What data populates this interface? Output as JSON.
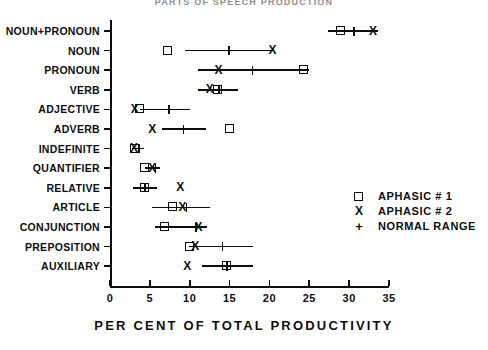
{
  "chart_data": {
    "type": "scatter",
    "title": "PARTS OF SPEECH PRODUCTION",
    "xlabel": "PER CENT OF TOTAL PRODUCTIVITY",
    "ylabel": "",
    "xlim": [
      0,
      35
    ],
    "xticks": [
      0,
      5,
      10,
      15,
      20,
      25,
      30,
      35
    ],
    "xticklabels": [
      "0",
      "5",
      "10",
      "15",
      "20",
      "25",
      "30",
      "35"
    ],
    "grid": false,
    "legend_position": "middle-right",
    "categories": [
      "NOUN+PRONOUN",
      "NOUN",
      "PRONOUN",
      "VERB",
      "ADJECTIVE",
      "ADVERB",
      "INDEFINITE",
      "QUANTIFIER",
      "RELATIVE",
      "ARTICLE",
      "CONJUNCTION",
      "PREPOSITION",
      "AUXILIARY"
    ],
    "series": [
      {
        "name": "APHASIC # 1",
        "marker": "square",
        "values": [
          29.0,
          7.3,
          24.3,
          13.6,
          3.8,
          15.1,
          3.2,
          4.4,
          4.4,
          7.9,
          6.9,
          10.0,
          14.7
        ]
      },
      {
        "name": "APHASIC # 2",
        "marker": "x",
        "values": [
          33.0,
          20.4,
          13.6,
          12.5,
          3.1,
          5.3,
          3.0,
          5.3,
          8.8,
          9.1,
          11.1,
          10.7,
          9.7
        ]
      },
      {
        "name": "NORMAL RANGE",
        "marker": "line-with-tick",
        "ranges": [
          [
            27.3,
            33.6
          ],
          [
            9.4,
            20.5
          ],
          [
            11.1,
            25.0
          ],
          [
            11.0,
            16.1
          ],
          [
            3.8,
            10.0
          ],
          [
            6.5,
            12.0
          ],
          [
            2.8,
            4.3
          ],
          [
            4.4,
            6.3
          ],
          [
            2.9,
            5.9
          ],
          [
            5.3,
            12.6
          ],
          [
            5.7,
            12.2
          ],
          [
            9.9,
            18.0
          ],
          [
            11.6,
            18.0
          ]
        ],
        "medians": [
          30.6,
          14.9,
          17.9,
          13.7,
          7.4,
          9.2,
          3.7,
          5.7,
          4.4,
          9.6,
          10.8,
          14.1,
          14.7
        ]
      }
    ]
  },
  "legend": {
    "entries": [
      {
        "marker": "square-marker",
        "label": "APHASIC # 1"
      },
      {
        "marker": "x-marker",
        "label": "APHASIC # 2"
      },
      {
        "marker": "plus-marker",
        "label": "NORMAL RANGE"
      }
    ]
  },
  "markers": {
    "x_glyph": "X",
    "plus_glyph": "+"
  }
}
